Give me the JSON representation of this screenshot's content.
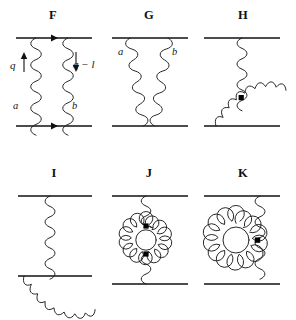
{
  "figure": {
    "type": "feynman-diagram-set",
    "background_color": "#ffffff",
    "ink_color": "#111111",
    "width": 296,
    "height": 320,
    "rows": 2,
    "columns": 3
  },
  "panels": [
    {
      "id": "F",
      "label": "F",
      "row": 1,
      "column": 1,
      "description": "two parallel gluon exchange between two fermion lines",
      "label_x": 41,
      "label_y": 8,
      "origin_x": 6,
      "origin_y": 30,
      "annotations": [
        {
          "name": "momentum-q",
          "text": "q",
          "x": 10,
          "y": 59,
          "kind": "momentum"
        },
        {
          "name": "color-index-a",
          "text": "a",
          "x": 13,
          "y": 100,
          "kind": "index"
        },
        {
          "name": "momentum-q-minus-l",
          "text": "q − l",
          "x": 73,
          "y": 58,
          "kind": "momentum"
        },
        {
          "name": "color-index-b",
          "text": "b",
          "x": 72,
          "y": 100,
          "kind": "index"
        }
      ]
    },
    {
      "id": "G",
      "label": "G",
      "row": 1,
      "column": 2,
      "description": "crossed gluon exchange between two fermion lines",
      "label_x": 137,
      "label_y": 8,
      "origin_x": 104,
      "origin_y": 30,
      "annotations": [
        {
          "name": "color-index-a",
          "text": "a",
          "x": 118,
          "y": 46,
          "kind": "index"
        },
        {
          "name": "color-index-b",
          "text": "b",
          "x": 172,
          "y": 46,
          "kind": "index"
        }
      ]
    },
    {
      "id": "H",
      "label": "H",
      "row": 1,
      "column": 3,
      "description": "three-gluon vertex with gluon arc above the lower fermion line",
      "label_x": 231,
      "label_y": 8,
      "origin_x": 196,
      "origin_y": 30,
      "annotations": []
    },
    {
      "id": "I",
      "label": "I",
      "row": 2,
      "column": 1,
      "description": "three-gluon vertex with gluon arc below the lower fermion line",
      "label_x": 42,
      "label_y": 166,
      "origin_x": 6,
      "origin_y": 188,
      "annotations": []
    },
    {
      "id": "J",
      "label": "J",
      "row": 2,
      "column": 2,
      "description": "gluon self-energy bubble inserted in a vertical gluon exchange",
      "label_x": 137,
      "label_y": 166,
      "origin_x": 104,
      "origin_y": 188,
      "annotations": []
    },
    {
      "id": "K",
      "label": "K",
      "row": 2,
      "column": 3,
      "description": "gluon tadpole loop attached to a vertical gluon exchange",
      "label_x": 231,
      "label_y": 166,
      "origin_x": 196,
      "origin_y": 188,
      "annotations": []
    }
  ],
  "legend": {
    "fermion_line": "solid horizontal line",
    "gluon_line": "coiled spring line",
    "vertex_marker": "filled square"
  }
}
